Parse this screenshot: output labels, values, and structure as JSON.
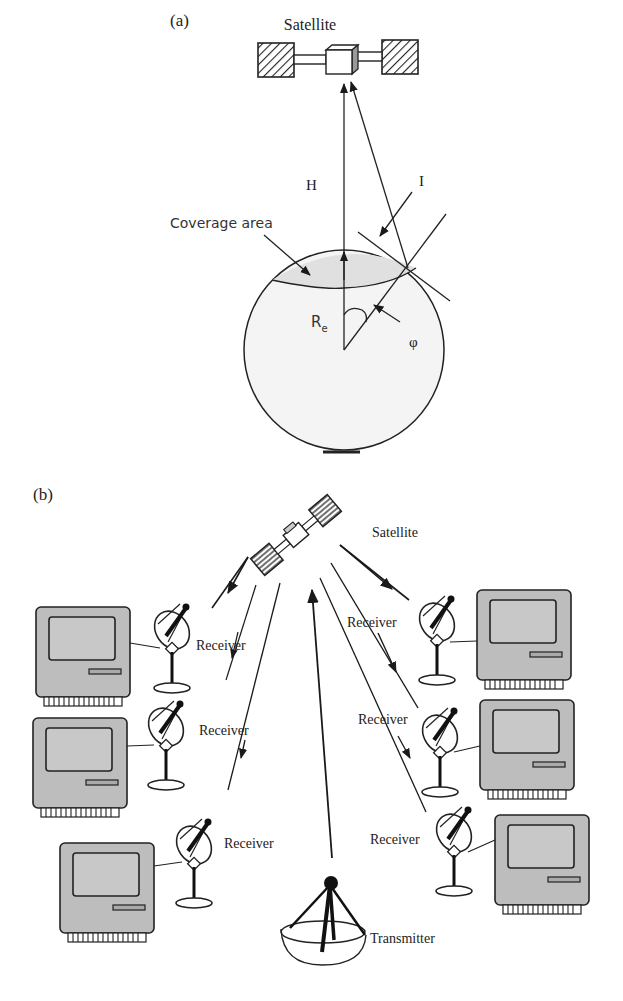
{
  "panel_a": {
    "label": "(a)",
    "satellite_label": "Satellite",
    "height_label": "H",
    "incidence_label": "I",
    "coverage_label": "Coverage area",
    "radius_label": "R",
    "radius_sub": "e",
    "angle_label": "φ"
  },
  "panel_b": {
    "label": "(b)",
    "satellite_label": "Satellite",
    "receivers": [
      {
        "label": "Receiver",
        "side": "left"
      },
      {
        "label": "Receiver",
        "side": "left"
      },
      {
        "label": "Receiver",
        "side": "left"
      },
      {
        "label": "Receiver",
        "side": "right"
      },
      {
        "label": "Receiver",
        "side": "right"
      },
      {
        "label": "Receiver",
        "side": "right"
      }
    ],
    "transmitter_label": "Transmitter"
  },
  "colors": {
    "line": "#1a1a1a",
    "computer_fill": "#bdbdbd",
    "earth_fill": "#f3f3f3",
    "coverage_fill": "#e0e0e0"
  }
}
